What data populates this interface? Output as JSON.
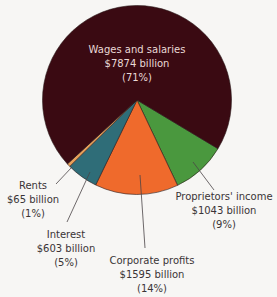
{
  "chart_data": {
    "type": "pie",
    "title": "",
    "units": "billion dollars",
    "start_angle_deg": 31,
    "direction": "clockwise",
    "slices": [
      {
        "name": "Proprietors' income",
        "value": 1043,
        "percent": 9,
        "value_label": "$1043 billion",
        "percent_label": "(9%)",
        "color": "#4a983e"
      },
      {
        "name": "Corporate profits",
        "value": 1595,
        "percent": 14,
        "value_label": "$1595 billion",
        "percent_label": "(14%)",
        "color": "#ef6a2c"
      },
      {
        "name": "Interest",
        "value": 603,
        "percent": 5,
        "value_label": "$603 billion",
        "percent_label": "(5%)",
        "color": "#2f6d78"
      },
      {
        "name": "Rents",
        "value": 65,
        "percent": 1,
        "value_label": "$65 billion",
        "percent_label": "(1%)",
        "color": "#e6a05a"
      },
      {
        "name": "Wages and salaries",
        "value": 7874,
        "percent": 71,
        "value_label": "$7874 billion",
        "percent_label": "(71%)",
        "color": "#3a0a12"
      }
    ]
  }
}
